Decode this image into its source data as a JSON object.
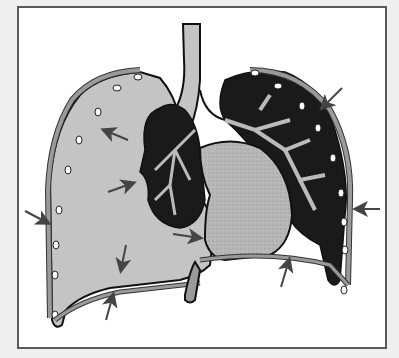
{
  "diagram": {
    "type": "anatomical-illustration",
    "labels": [],
    "colors": {
      "background": "#efefef",
      "frame_fill": "#ffffff",
      "frame_border": "#5a5a5a",
      "pleural_space": "#c4c4c4",
      "lung_tissue": "#1a1a1a",
      "heart": "#b8b8b8",
      "arrow": "#444444",
      "outline": "#111111"
    },
    "arrows": [
      {
        "id": "arrow-upper-left-inner",
        "x": 115,
        "y": 138,
        "direction": "up-left"
      },
      {
        "id": "arrow-upper-right",
        "x": 330,
        "y": 95,
        "direction": "down-left"
      },
      {
        "id": "arrow-mid-left-outer",
        "x": 40,
        "y": 215,
        "direction": "down-right"
      },
      {
        "id": "arrow-mid-left-inner",
        "x": 125,
        "y": 185,
        "direction": "up-right"
      },
      {
        "id": "arrow-right-outer",
        "x": 365,
        "y": 208,
        "direction": "left"
      },
      {
        "id": "arrow-heart-left",
        "x": 185,
        "y": 235,
        "direction": "right"
      },
      {
        "id": "arrow-lower-left-down",
        "x": 122,
        "y": 255,
        "direction": "down"
      },
      {
        "id": "arrow-lower-left-up",
        "x": 110,
        "y": 308,
        "direction": "up"
      },
      {
        "id": "arrow-lower-right-up",
        "x": 285,
        "y": 270,
        "direction": "up"
      }
    ]
  }
}
